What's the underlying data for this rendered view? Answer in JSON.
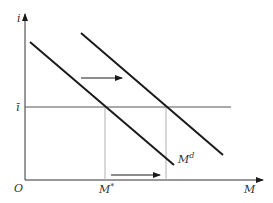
{
  "diagram": {
    "axes": {
      "y_label": "i",
      "x_label": "M",
      "origin_label": "O"
    },
    "levels": {
      "i_bar_label": "ī",
      "m_star_label": "M*",
      "md_label": "Md",
      "md_base": "M",
      "md_sup": "d",
      "m_star_base": "M",
      "m_star_sup": "*"
    },
    "curves": [
      {
        "name": "money-demand-original",
        "x1": 30,
        "y1": 42,
        "x2": 174,
        "y2": 165
      },
      {
        "name": "money-demand-shifted",
        "x1": 81,
        "y1": 33,
        "x2": 223,
        "y2": 155
      }
    ],
    "arrows": [
      {
        "name": "demand-shift-arrow",
        "direction": "right"
      },
      {
        "name": "money-quantity-shift-arrow",
        "direction": "right"
      }
    ],
    "colors": {
      "line": "#1a1a1a",
      "guide": "#b0b0b0",
      "axis": "#333333"
    }
  }
}
